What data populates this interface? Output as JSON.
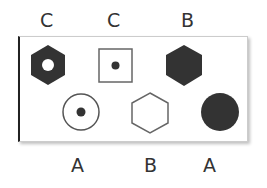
{
  "top_labels": [
    "C",
    "C",
    "B"
  ],
  "bottom_labels": [
    "A",
    "B",
    "A"
  ],
  "shapes": {
    "top": [
      "hexagon-filled-with-hole",
      "square-outline-with-dot",
      "hexagon-filled"
    ],
    "bottom": [
      "circle-outline-with-dot",
      "hexagon-outline",
      "circle-filled"
    ]
  },
  "colors": {
    "fill": "#333333",
    "outline": "#555555"
  }
}
